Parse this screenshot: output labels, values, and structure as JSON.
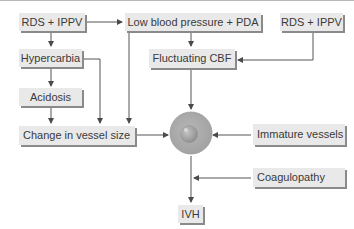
{
  "diagram": {
    "type": "flowchart",
    "nodes": {
      "rds_ippv_left": "RDS + IPPV",
      "low_bp_pda": "Low blood pressure + PDA",
      "rds_ippv_right": "RDS + IPPV",
      "hypercarbia": "Hypercarbia",
      "fluctuating_cbf": "Fluctuating CBF",
      "acidosis": "Acidosis",
      "change_vessel_size": "Change in vessel size",
      "vessel_icon": "Blood vessel (circle)",
      "immature_vessels": "Immature vessels",
      "coagulopathy": "Coagulopathy",
      "ivh": "IVH"
    },
    "edges": [
      {
        "from": "RDS + IPPV (left)",
        "to": "Low blood pressure + PDA"
      },
      {
        "from": "RDS + IPPV (left)",
        "to": "Hypercarbia"
      },
      {
        "from": "Hypercarbia",
        "to": "Acidosis"
      },
      {
        "from": "Hypercarbia",
        "to": "Change in vessel size"
      },
      {
        "from": "Acidosis",
        "to": "Change in vessel size"
      },
      {
        "from": "Low blood pressure + PDA",
        "to": "Change in vessel size"
      },
      {
        "from": "Low blood pressure + PDA",
        "to": "Fluctuating CBF"
      },
      {
        "from": "RDS + IPPV (right)",
        "to": "Fluctuating CBF"
      },
      {
        "from": "Fluctuating CBF",
        "to": "Blood vessel"
      },
      {
        "from": "Change in vessel size",
        "to": "Blood vessel"
      },
      {
        "from": "Immature vessels",
        "to": "Blood vessel"
      },
      {
        "from": "Blood vessel",
        "to": "IVH"
      },
      {
        "from": "Coagulopathy",
        "to": "IVH path"
      }
    ],
    "colors": {
      "box_fill": "#e9e9e9",
      "box_shadow": "#8a8a8a",
      "text": "#3a3a3a",
      "line": "#555555",
      "circle": "#a9a9a9"
    }
  }
}
